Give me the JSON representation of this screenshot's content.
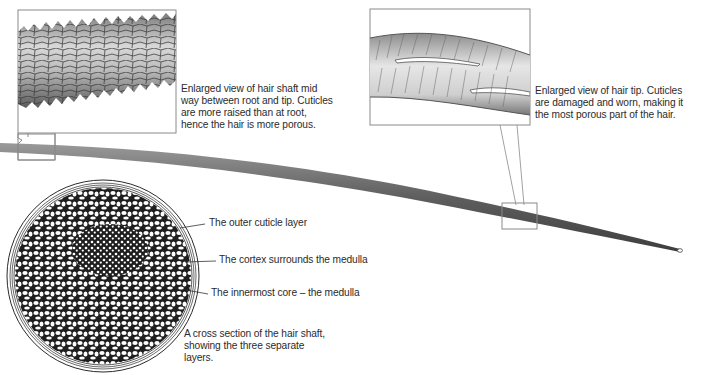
{
  "diagram": {
    "callouts": {
      "mid_shaft": {
        "lines": [
          "Enlarged view of hair shaft mid",
          "way between root and tip. Cuticles",
          "are more raised than at root,",
          "hence the hair is more porous."
        ]
      },
      "tip": {
        "lines": [
          "Enlarged view of hair tip. Cuticles",
          "are damaged and worn, making it",
          "the most porous part of the hair."
        ]
      }
    },
    "cross_section": {
      "labels": {
        "cuticle": "The outer cuticle layer",
        "cortex": "The cortex surrounds the medulla",
        "medulla": "The innermost core – the medulla"
      },
      "caption": {
        "lines": [
          "A cross section of the hair shaft,",
          "showing the three separate",
          "layers."
        ]
      }
    },
    "colors": {
      "shaft": "#5a5a5a",
      "outline": "#8a8a8a",
      "ink": "#2b2b2b"
    }
  }
}
